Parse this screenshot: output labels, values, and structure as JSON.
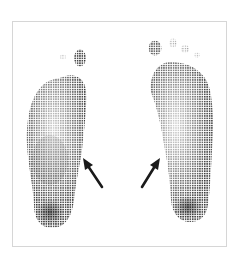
{
  "figure": {
    "colors": {
      "background": "#ffffff",
      "frame_border": "#d6d6d6",
      "print_dark": "#2a2a2a",
      "print_mid": "#6a6a6a",
      "arrow": "#1a1a1a"
    },
    "feet": [
      {
        "side": "left",
        "label": "left-footprint"
      },
      {
        "side": "right",
        "label": "right-footprint"
      }
    ],
    "arrows": [
      {
        "label": "left-arrow",
        "tip": [
          83,
          158
        ],
        "tail": [
          102,
          187
        ]
      },
      {
        "label": "right-arrow",
        "tip": [
          160,
          158
        ],
        "tail": [
          142,
          187
        ]
      }
    ]
  }
}
